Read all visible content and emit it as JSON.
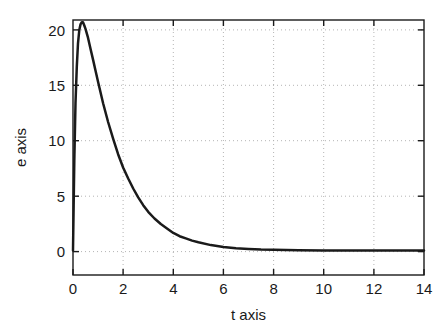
{
  "chart_data": {
    "type": "line",
    "title": "",
    "subtitle": "",
    "xlabel": "t axis",
    "ylabel": "e axis",
    "xlim": [
      0,
      14
    ],
    "ylim": [
      -2.2,
      20.8
    ],
    "xticks": [
      0,
      2,
      4,
      6,
      8,
      10,
      12,
      14
    ],
    "xticklabels": [
      "0",
      "2",
      "4",
      "6",
      "8",
      "10",
      "12",
      "14"
    ],
    "yticks": [
      0,
      5,
      10,
      15,
      20
    ],
    "yticklabels": [
      "0",
      "5",
      "10",
      "15",
      "20"
    ],
    "grid": true,
    "grid_style": "dotted",
    "grid_color": "#b4b4b4",
    "legend": null,
    "annotations": [],
    "series": [
      {
        "name": "e(t)",
        "color": "#1a1a1a",
        "line_width": 2.5,
        "description": "Sharp rise from zero to a peak of about 20.6 near t = 0.4, followed by exponential decay toward zero by about t = 7.",
        "x": [
          0,
          0.05,
          0.1,
          0.15,
          0.2,
          0.25,
          0.3,
          0.35,
          0.4,
          0.45,
          0.5,
          0.6,
          0.7,
          0.8,
          0.9,
          1.0,
          1.2,
          1.4,
          1.6,
          1.8,
          2.0,
          2.2,
          2.4,
          2.6,
          2.8,
          3.0,
          3.25,
          3.5,
          3.75,
          4.0,
          4.25,
          4.5,
          4.75,
          5.0,
          5.5,
          6.0,
          6.5,
          7.0,
          7.5,
          8.0,
          9.0,
          10.0,
          11.0,
          12.0,
          13.0,
          14.0
        ],
        "y": [
          0,
          8.1,
          13.3,
          16.6,
          18.7,
          19.9,
          20.4,
          20.6,
          20.6,
          20.3,
          20.0,
          19.2,
          18.2,
          17.2,
          16.2,
          15.2,
          13.3,
          11.6,
          10.1,
          8.7,
          7.5,
          6.5,
          5.6,
          4.8,
          4.1,
          3.5,
          2.9,
          2.4,
          2.0,
          1.6,
          1.3,
          1.1,
          0.9,
          0.75,
          0.5,
          0.33,
          0.22,
          0.15,
          0.1,
          0.07,
          0.03,
          0.01,
          0.0,
          0.0,
          0.0,
          0.0
        ]
      }
    ],
    "peak": {
      "t": 0.4,
      "e": 20.6
    }
  },
  "figure": {
    "background_color": "#ffffff",
    "axes_color": "#1a1a1a",
    "plot_area": {
      "left": 73,
      "top": 20,
      "right": 424,
      "bottom": 275
    }
  }
}
